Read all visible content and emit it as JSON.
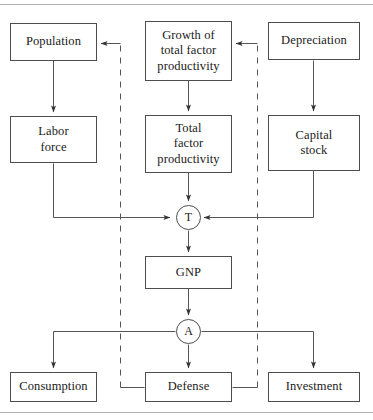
{
  "figure": {
    "background_color": "#ffffff",
    "line_color": "#4d4d4d",
    "rule_color": "#b3b3b3",
    "text_color": "#1a1a1a"
  },
  "rules": {
    "top_label": "top-divider-rule",
    "bottom_label": "bottom-divider-rule"
  },
  "nodes": {
    "population": {
      "label": "Population"
    },
    "growth_tfp": {
      "line1": "Growth of",
      "line2": "total factor",
      "line3": "productivity"
    },
    "depreciation": {
      "label": "Depreciation"
    },
    "labor_force": {
      "line1": "Labor",
      "line2": "force"
    },
    "total_factor_productivity": {
      "line1": "Total",
      "line2": "factor",
      "line3": "productivity"
    },
    "capital_stock": {
      "line1": "Capital",
      "line2": "stock"
    },
    "gnp": {
      "label": "GNP"
    },
    "consumption": {
      "label": "Consumption"
    },
    "defense": {
      "label": "Defense"
    },
    "investment": {
      "label": "Investment"
    }
  },
  "junctions": {
    "production": {
      "label": "T"
    },
    "allocation": {
      "label": "A"
    }
  },
  "edges": {
    "population_to_labor": "Population to Labor force",
    "growth_to_tfp": "Growth of total factor productivity to Total factor productivity",
    "depreciation_to_capital": "Depreciation to Capital stock",
    "labor_to_production": "Labor force to production junction T",
    "tfp_to_production": "Total factor productivity to production junction T",
    "capital_to_production": "Capital stock to production junction T",
    "production_to_gnp": "Production junction T to GNP",
    "gnp_to_allocation": "GNP to allocation junction A",
    "allocation_to_consumption": "Allocation junction A to Consumption",
    "allocation_to_defense": "Allocation junction A to Defense",
    "allocation_to_investment": "Allocation junction A to Investment",
    "defense_feedback_left": "Defense feedback to Population",
    "defense_feedback_right": "Defense feedback to Growth of total factor productivity"
  }
}
